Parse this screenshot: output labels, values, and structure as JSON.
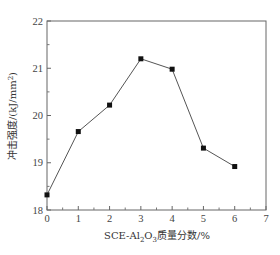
{
  "chart_data": {
    "type": "line",
    "title": "",
    "xlabel": "SCE-Al2O3质量分数/%",
    "xlabel_parts": {
      "prefix": "SCE-Al",
      "sub1": "2",
      "mid": "O",
      "sub2": "3",
      "suffix": "质量分数/%"
    },
    "ylabel": "冲击强度/(kJ/mm²)",
    "ylabel_parts": {
      "main": "冲击强度/(kJ/mm",
      "sup": "2",
      "end": ")"
    },
    "x": [
      0,
      1,
      2,
      3,
      4,
      5,
      6
    ],
    "values": [
      18.32,
      19.66,
      20.22,
      21.2,
      20.98,
      19.31,
      18.92
    ],
    "series": [
      {
        "name": "冲击强度",
        "x": [
          0,
          1,
          2,
          3,
          4,
          5,
          6
        ],
        "values": [
          18.32,
          19.66,
          20.22,
          21.2,
          20.98,
          19.31,
          18.92
        ],
        "marker": "square",
        "line_color": "#555555",
        "marker_color": "#111111"
      }
    ],
    "xlim": [
      0,
      7
    ],
    "ylim": [
      18,
      22
    ],
    "xticks": [
      0,
      1,
      2,
      3,
      4,
      5,
      6,
      7
    ],
    "xtick_labels": [
      "0",
      "1",
      "2",
      "3",
      "4",
      "5",
      "6",
      "7"
    ],
    "yticks": [
      18,
      19,
      20,
      21,
      22
    ],
    "ytick_labels": [
      "18",
      "19",
      "20",
      "21",
      "22"
    ],
    "minor_ticks": true,
    "grid": false,
    "legend": null
  }
}
